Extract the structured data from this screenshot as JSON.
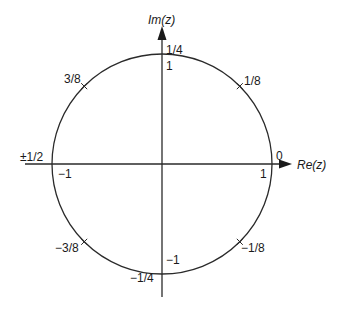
{
  "diagram": {
    "axes": {
      "real_label": "Re(z)",
      "imag_label": "Im(z)"
    },
    "axis_values": {
      "right": "1",
      "left": "−1",
      "top": "1",
      "bottom": "−1"
    },
    "frequency_labels": [
      {
        "id": "f0",
        "label": "0",
        "angle_deg": 0
      },
      {
        "id": "f1_8",
        "label": "1/8",
        "angle_deg": 45
      },
      {
        "id": "f1_4",
        "label": "1/4",
        "angle_deg": 90
      },
      {
        "id": "f3_8",
        "label": "3/8",
        "angle_deg": 135
      },
      {
        "id": "fhalf",
        "label": "±1/2",
        "angle_deg": 180
      },
      {
        "id": "fm3_8",
        "label": "−3/8",
        "angle_deg": 225
      },
      {
        "id": "fm1_4",
        "label": "−1/4",
        "angle_deg": 270
      },
      {
        "id": "fm1_8",
        "label": "−1/8",
        "angle_deg": 315
      }
    ],
    "colors": {
      "stroke": "#2a2a2a",
      "text": "#1a1a1a",
      "background": "#ffffff"
    }
  }
}
